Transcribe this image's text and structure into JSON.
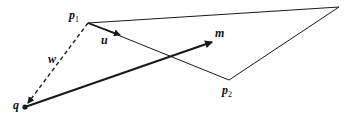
{
  "diagram": {
    "type": "vector geometry figure",
    "points": {
      "p1": {
        "label": "p",
        "sub": "1",
        "x": 88,
        "y": 23
      },
      "p2": {
        "label": "p",
        "sub": "2",
        "x": 229,
        "y": 80
      },
      "apex": {
        "x": 339,
        "y": 7
      },
      "q": {
        "label": "q",
        "x": 25,
        "y": 107
      }
    },
    "vectors": {
      "u": {
        "label": "u"
      },
      "w": {
        "label": "w"
      },
      "m": {
        "label": "m"
      }
    },
    "colors": {
      "stroke": "#1a1a1a"
    }
  }
}
